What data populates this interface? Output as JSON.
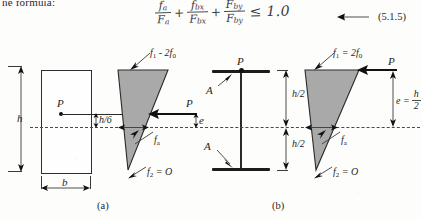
{
  "page": {
    "intro_text": "he formula:",
    "equation_number": "(5.1.5)"
  },
  "formula": {
    "term1": {
      "numerator": "f",
      "numerator_sub": "a",
      "denominator": "F",
      "denominator_sub": "a"
    },
    "plus1": "+",
    "term2": {
      "numerator": "f",
      "numerator_sub": "bx",
      "denominator": "F",
      "denominator_sub": "bx"
    },
    "plus2": "+",
    "term3": {
      "numerator": "F",
      "numerator_sub": "by",
      "denominator": "F",
      "denominator_sub": "by"
    },
    "relation": "≤",
    "limit": "1.0"
  },
  "figure_a": {
    "caption": "(a)",
    "height_label": "h",
    "width_label": "b",
    "load_label_section": "P",
    "load_label_stress": "P",
    "eccentricity_label": "e",
    "offset_label": "h/6",
    "top_stress_label": "f",
    "top_stress_sub": "1",
    "top_stress_rest": " - 2f",
    "top_stress_rest_sub": "0",
    "axial_stress_label": "f",
    "axial_stress_sub": "a",
    "bottom_stress_label": "f",
    "bottom_stress_sub": "2",
    "bottom_stress_rest": " = O"
  },
  "figure_b": {
    "caption": "(b)",
    "flange_label_top": "A",
    "flange_label_bottom": "A",
    "load_label_section": "P",
    "load_label_stress": "P",
    "half_height_top": "h/2",
    "half_height_bottom": "h/2",
    "eccentricity_label": "e =",
    "eccentricity_num": "h",
    "eccentricity_den": "2",
    "top_stress_label": "f",
    "top_stress_sub": "1",
    "top_stress_rest": " = 2f",
    "top_stress_rest_sub": "0",
    "axial_stress_label": "f",
    "axial_stress_sub": "a",
    "bottom_stress_label": "f",
    "bottom_stress_sub": "2",
    "bottom_stress_rest": " = O"
  },
  "colors": {
    "stress_fill": "#a9a9a9",
    "ink": "#2e2e2e",
    "handwriting": "#3b3b3b",
    "paper": "#fdfdfb"
  }
}
